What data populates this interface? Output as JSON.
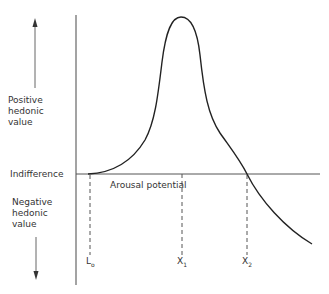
{
  "diagram": {
    "title": "",
    "y_axis": {
      "positive_label": "Positive hedonic value",
      "negative_label": "Negative hedonic value",
      "positive_lines": [
        "Positive",
        "hedonic",
        "value"
      ],
      "negative_lines": [
        "Negative",
        "hedonic",
        "value"
      ]
    },
    "baseline_label": "Indifference",
    "x_axis_label": "Arousal potential",
    "markers": [
      {
        "id": "L0",
        "main": "L",
        "sub": "o"
      },
      {
        "id": "X1",
        "main": "X",
        "sub": "1"
      },
      {
        "id": "X2",
        "main": "X",
        "sub": "2"
      }
    ],
    "curve_description": "Hedonic value rises from indifference at L0, peaks at X1, crosses indifference at X2, and falls into negative hedonic value",
    "colors": {
      "line": "#222222",
      "axis": "#555555",
      "text": "#333333"
    }
  }
}
